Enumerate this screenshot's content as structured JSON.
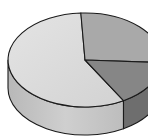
{
  "chart_data": {
    "type": "pie",
    "style": "3d",
    "title": "",
    "categories": [
      "Slice A",
      "Slice B",
      "Slice C"
    ],
    "values": [
      57.5,
      26.7,
      15.8
    ],
    "start_angles_deg": [
      93,
      357,
      300
    ],
    "colors": {
      "top": [
        "#dcdcdc",
        "#a9a9a9",
        "#868686"
      ],
      "side": [
        "#c4c4c4",
        "#8f8f8f",
        "#6e6e6e"
      ],
      "outline": "#1a1a1a"
    },
    "legend": null,
    "labels_visible": false
  },
  "geometry": {
    "cx": 85,
    "cy": 60,
    "rx": 77,
    "ry": 47,
    "depth": 28
  }
}
